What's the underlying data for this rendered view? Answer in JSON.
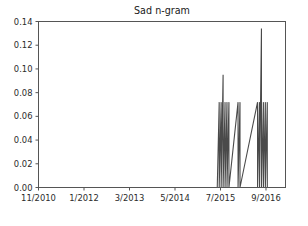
{
  "chart_data": {
    "type": "line",
    "title": "Sad n-gram",
    "xlabel": "",
    "ylabel": "",
    "grid": false,
    "legend": false,
    "ylim": [
      0.0,
      0.14
    ],
    "ytick_labels": [
      "0.00",
      "0.02",
      "0.04",
      "0.06",
      "0.08",
      "0.10",
      "0.12",
      "0.14"
    ],
    "ytick_values": [
      0.0,
      0.02,
      0.04,
      0.06,
      0.08,
      0.1,
      0.12,
      0.14
    ],
    "xtick_labels": [
      "11/2010",
      "1/2012",
      "3/2013",
      "5/2014",
      "7/2015",
      "9/2016"
    ],
    "xtick_values": [
      0,
      14,
      28,
      42,
      56,
      70
    ],
    "xlim": [
      0,
      76
    ],
    "line_color": "#4a4a4a",
    "series": [
      {
        "name": "Sad n-gram frequency",
        "x": [
          0,
          55,
          55.6,
          55.6,
          56.2,
          56.2,
          56.8,
          56.8,
          57.4,
          57.4,
          58.0,
          58.0,
          58.6,
          58.6,
          61.4,
          61.4,
          62.0,
          62.0,
          67.4,
          67.4,
          68.0,
          68.0,
          68.6,
          68.6,
          69.2,
          69.2,
          69.8,
          69.8,
          70.4,
          70.4,
          76
        ],
        "values": [
          0.0,
          0.0,
          0.072,
          0.0,
          0.072,
          0.0,
          0.095,
          0.0,
          0.072,
          0.0,
          0.072,
          0.0,
          0.072,
          0.0,
          0.072,
          0.0,
          0.072,
          0.0,
          0.072,
          0.0,
          0.072,
          0.0,
          0.134,
          0.0,
          0.072,
          0.0,
          0.072,
          0.0,
          0.072,
          0.0,
          0.0
        ]
      }
    ],
    "peaks": [
      {
        "label": "peak-cluster-1",
        "approx_x": "7/2015+",
        "max_value": 0.095,
        "base_value": 0.072
      },
      {
        "label": "peak-single-2",
        "approx_x": "between 7/2015 and 9/2016",
        "max_value": 0.072,
        "base_value": 0.072
      },
      {
        "label": "peak-cluster-3",
        "approx_x": "9/2016",
        "max_value": 0.134,
        "base_value": 0.072
      }
    ]
  }
}
